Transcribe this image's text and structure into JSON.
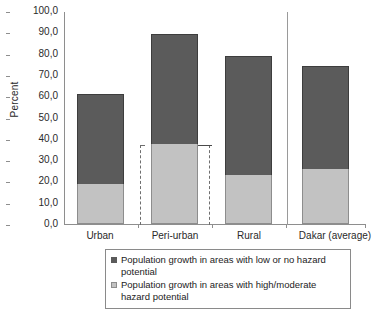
{
  "chart_data": {
    "type": "bar",
    "stacked": true,
    "title": "",
    "xlabel": "",
    "ylabel": "Percent",
    "ylim": [
      0,
      100
    ],
    "ytick_labels": [
      "100,0",
      "90,0",
      "80,0",
      "70,0",
      "60,0",
      "50,0",
      "40,0",
      "30,0",
      "20,0",
      "10,0",
      "0,0"
    ],
    "ytick_values": [
      100,
      90,
      80,
      70,
      60,
      50,
      40,
      30,
      20,
      10,
      0
    ],
    "grid": false,
    "legend_position": "bottom",
    "categories": [
      "Urban",
      "Peri-urban",
      "Rural",
      "Dakar (average)"
    ],
    "series": [
      {
        "name": "Population growth in areas with high/moderate hazard potential",
        "key": "high_moderate",
        "color": "#c2c2c2",
        "values": [
          19.0,
          37.5,
          23.0,
          26.0
        ]
      },
      {
        "name": "Population growth in areas with low or no hazard potential",
        "key": "low_none",
        "color": "#5b5b5b",
        "values": [
          42.0,
          51.5,
          56.0,
          48.0
        ]
      }
    ],
    "totals": [
      61.0,
      89.0,
      79.0,
      74.0
    ],
    "annotations": [
      {
        "type": "dashed-bracket",
        "category": "Peri-urban",
        "from_value": 0,
        "to_value": 37.5,
        "note": "dashed vertical brackets flanking the high/moderate segment of Peri-urban"
      },
      {
        "type": "vertical-separator",
        "before_category": "Dakar (average)",
        "note": "thin vertical rule separating Dakar (average) from the three zone bars"
      }
    ]
  },
  "legend": {
    "items": [
      {
        "swatch": "dark",
        "label": "Population growth in areas with low or no hazard potential"
      },
      {
        "swatch": "light",
        "label": "Population growth in areas with high/moderate hazard potential"
      }
    ]
  },
  "axis": {
    "y_title": "Percent"
  }
}
